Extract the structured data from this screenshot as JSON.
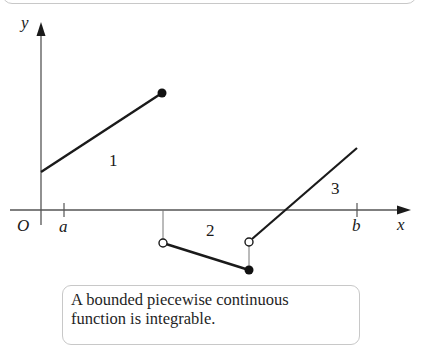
{
  "figure": {
    "axes": {
      "x_label": "x",
      "y_label": "y",
      "origin_label": "O",
      "ticks": [
        {
          "label": "a",
          "x": 64
        },
        {
          "label": "b",
          "x": 357
        }
      ]
    },
    "regions": [
      {
        "label": "1"
      },
      {
        "label": "2"
      },
      {
        "label": "3"
      }
    ],
    "segments": [
      {
        "id": 1,
        "from": [
          41,
          172
        ],
        "to": [
          162,
          93
        ],
        "start": "none",
        "end": "closed"
      },
      {
        "id": 2,
        "from": [
          163,
          243
        ],
        "to": [
          249,
          270
        ],
        "start": "open",
        "end": "closed"
      },
      {
        "id": 3,
        "from": [
          249,
          242
        ],
        "to": [
          357,
          148
        ],
        "start": "open",
        "end": "none"
      }
    ],
    "stroke_color": "#1a1a1a"
  },
  "caption": {
    "line1": "A bounded piecewise continuous",
    "line2": "function is integrable."
  }
}
